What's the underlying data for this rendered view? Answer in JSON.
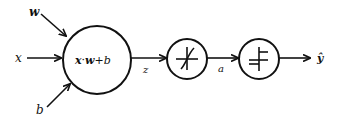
{
  "diagram": {
    "type": "neuron-computation-graph",
    "inputs": {
      "w": "w",
      "x": "x",
      "b": "b"
    },
    "nodes": {
      "linear": {
        "label_x": "x",
        "label_dot": "·",
        "label_w": "w",
        "label_plus_b": "+b"
      },
      "activation1": {
        "icon": "sigmoid-curve-icon"
      },
      "activation2": {
        "icon": "step-function-icon"
      }
    },
    "edges": {
      "z": "z",
      "a": "a",
      "y_hat": "ŷ"
    },
    "colors": {
      "stroke": "#111111",
      "background": "#ffffff"
    }
  }
}
